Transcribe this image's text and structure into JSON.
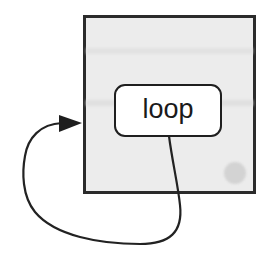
{
  "diagram": {
    "type": "loop-flow",
    "outer_box": {
      "fill": "#ececec",
      "stroke": "#2b2b2b"
    },
    "inner_node": {
      "label": "loop",
      "fill": "#ffffff",
      "stroke": "#1f1f1f"
    },
    "connector": {
      "description": "line leaves bottom of 'loop' node, exits box, curves around left and re-enters outer box via arrow",
      "stroke": "#222222",
      "arrowhead": "filled-triangle"
    },
    "marker_dot": {
      "fill": "#d3d3d3"
    }
  }
}
